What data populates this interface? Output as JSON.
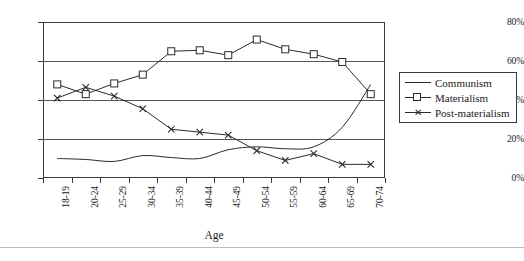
{
  "chart_data": {
    "type": "line",
    "title": "",
    "xlabel": "Age",
    "ylabel": "",
    "categories": [
      "18-19",
      "20-24",
      "25-29",
      "30-34",
      "35-39",
      "40-44",
      "45-49",
      "50-54",
      "55-59",
      "60-64",
      "65-69",
      "70-74"
    ],
    "yticks": [
      "0%",
      "20%",
      "40%",
      "60%",
      "80%"
    ],
    "ytick_values": [
      0,
      20,
      40,
      60,
      80
    ],
    "ylim": [
      0,
      80
    ],
    "grid": true,
    "legend_position": "right",
    "series": [
      {
        "name": "Communism",
        "marker": "none",
        "values": [
          10.0,
          9.5,
          8.5,
          11.5,
          10.5,
          10.0,
          14.5,
          16.0,
          15.0,
          16.0,
          26.0,
          48.0
        ]
      },
      {
        "name": "Materialism",
        "marker": "square",
        "values": [
          48.0,
          43.0,
          48.5,
          53.0,
          65.0,
          65.5,
          63.0,
          71.0,
          66.0,
          63.5,
          59.5,
          43.0
        ]
      },
      {
        "name": "Post-materialism",
        "marker": "cross",
        "values": [
          41.0,
          46.5,
          42.0,
          35.5,
          25.0,
          23.5,
          22.0,
          14.0,
          9.0,
          12.5,
          7.0,
          7.0
        ]
      }
    ]
  },
  "legend": {
    "items": [
      {
        "label": "Communism",
        "key": "line-key"
      },
      {
        "label": "Materialism",
        "key": "square-key"
      },
      {
        "label": "Post-materialism",
        "key": "cross-key"
      }
    ]
  },
  "axis": {
    "x_title": "Age"
  }
}
